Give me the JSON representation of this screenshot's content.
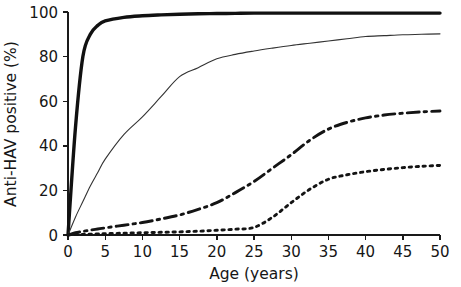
{
  "chart_data": {
    "type": "line",
    "title": "",
    "xlabel": "Age (years)",
    "ylabel": "Anti-HAV positive (%)",
    "xlim": [
      0,
      50
    ],
    "ylim": [
      0,
      100
    ],
    "xticks": [
      0,
      5,
      10,
      15,
      20,
      25,
      30,
      35,
      40,
      45,
      50
    ],
    "yticks": [
      0,
      20,
      40,
      60,
      80,
      100
    ],
    "xtick_labels": [
      "0",
      "5",
      "10",
      "15",
      "20",
      "25",
      "30",
      "35",
      "40",
      "45",
      "50"
    ],
    "ytick_labels": [
      "0",
      "20",
      "40",
      "60",
      "80",
      "100"
    ],
    "grid": false,
    "legend": "none",
    "x": [
      0,
      1,
      2,
      3,
      4,
      5,
      7.5,
      10,
      12.5,
      15,
      17.5,
      20,
      22.5,
      25,
      27.5,
      30,
      32.5,
      35,
      37.5,
      40,
      42.5,
      45,
      47.5,
      50
    ],
    "series": [
      {
        "name": "high-endemicity-curve",
        "style": "thick-solid",
        "color": "#111111",
        "stroke_width": 3.4,
        "dash": "none",
        "values": [
          0,
          48,
          80,
          90,
          94,
          96,
          97.6,
          98.3,
          98.7,
          99,
          99.2,
          99.3,
          99.4,
          99.5,
          99.5,
          99.5,
          99.5,
          99.5,
          99.5,
          99.5,
          99.5,
          99.5,
          99.5,
          99.5
        ]
      },
      {
        "name": "intermediate-endemicity-curve",
        "style": "thin-solid",
        "color": "#333333",
        "stroke_width": 1.1,
        "dash": "none",
        "values": [
          0,
          8,
          15,
          22,
          28,
          34,
          45,
          53,
          62,
          71,
          75,
          79,
          81,
          82.5,
          83.8,
          85,
          86,
          87,
          88,
          89,
          89.4,
          89.8,
          90,
          90.2
        ]
      },
      {
        "name": "low-endemicity-curve",
        "style": "dash-dot",
        "color": "#141414",
        "stroke_width": 2.9,
        "dash": "12,5,2.5,5",
        "values": [
          0,
          1,
          1.6,
          2.2,
          2.7,
          3.2,
          4.4,
          5.6,
          7.2,
          9,
          11.5,
          14.5,
          19,
          24,
          30,
          36,
          42.5,
          47.5,
          50.5,
          52.5,
          53.8,
          54.6,
          55.2,
          55.6
        ]
      },
      {
        "name": "very-low-endemicity-curve",
        "style": "dotted",
        "color": "#141414",
        "stroke_width": 2.9,
        "dash": "2.4,4.6",
        "values": [
          0,
          0.2,
          0.3,
          0.4,
          0.5,
          0.6,
          0.8,
          1.0,
          1.2,
          1.4,
          1.7,
          2.1,
          2.6,
          3.4,
          8,
          14.5,
          20.5,
          25,
          27,
          28.4,
          29.4,
          30.2,
          30.8,
          31.2
        ]
      }
    ]
  },
  "layout": {
    "plot_left": 68,
    "plot_right": 440,
    "plot_top": 12,
    "plot_bottom": 235
  }
}
